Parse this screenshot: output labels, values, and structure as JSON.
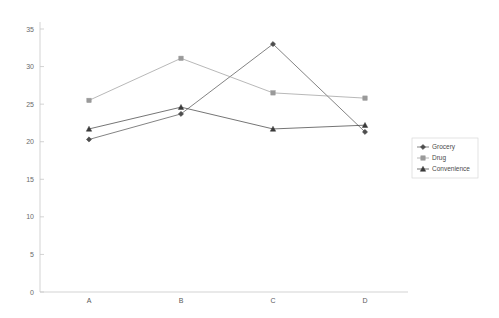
{
  "chart_data": {
    "type": "line",
    "title": "",
    "subtitle": "",
    "xlabel": "",
    "ylabel": "",
    "categories": [
      "A",
      "B",
      "C",
      "D"
    ],
    "ylim": [
      0,
      35
    ],
    "yticks": [
      0,
      5,
      10,
      15,
      20,
      25,
      30,
      35
    ],
    "ytick_labels": [
      "0",
      "5",
      "10",
      "15",
      "20",
      "25",
      "30",
      "35"
    ],
    "grid": false,
    "legend_position": "right",
    "series": [
      {
        "name": "Grocery",
        "marker": "diamond",
        "color": "#4d4d4d",
        "values": [
          20.3,
          23.7,
          33.0,
          21.3
        ]
      },
      {
        "name": "Drug",
        "marker": "square",
        "color": "#9a9a9a",
        "values": [
          25.5,
          31.1,
          26.5,
          25.8
        ]
      },
      {
        "name": "Convenience",
        "marker": "triangle",
        "color": "#3a3a3a",
        "values": [
          21.7,
          24.6,
          21.7,
          22.2
        ]
      }
    ]
  },
  "axis": {
    "line_color": "#c8c8c8"
  },
  "legend": {
    "entries": [
      "Grocery",
      "Drug",
      "Convenience"
    ]
  }
}
